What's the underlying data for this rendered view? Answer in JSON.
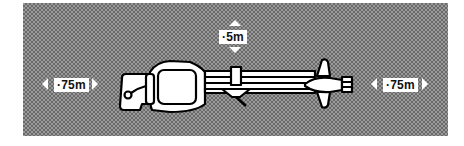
{
  "diagram": {
    "clearances": {
      "left": "·75m",
      "top": "·5m",
      "right": "·75m"
    },
    "colors": {
      "zone_pattern_dark": "#6a6a6a",
      "zone_pattern_light": "#9a9a9a",
      "vehicle_fill": "#ffffff",
      "vehicle_outline": "#000000",
      "label_bg": "#ffffff",
      "label_text": "#111111"
    }
  }
}
